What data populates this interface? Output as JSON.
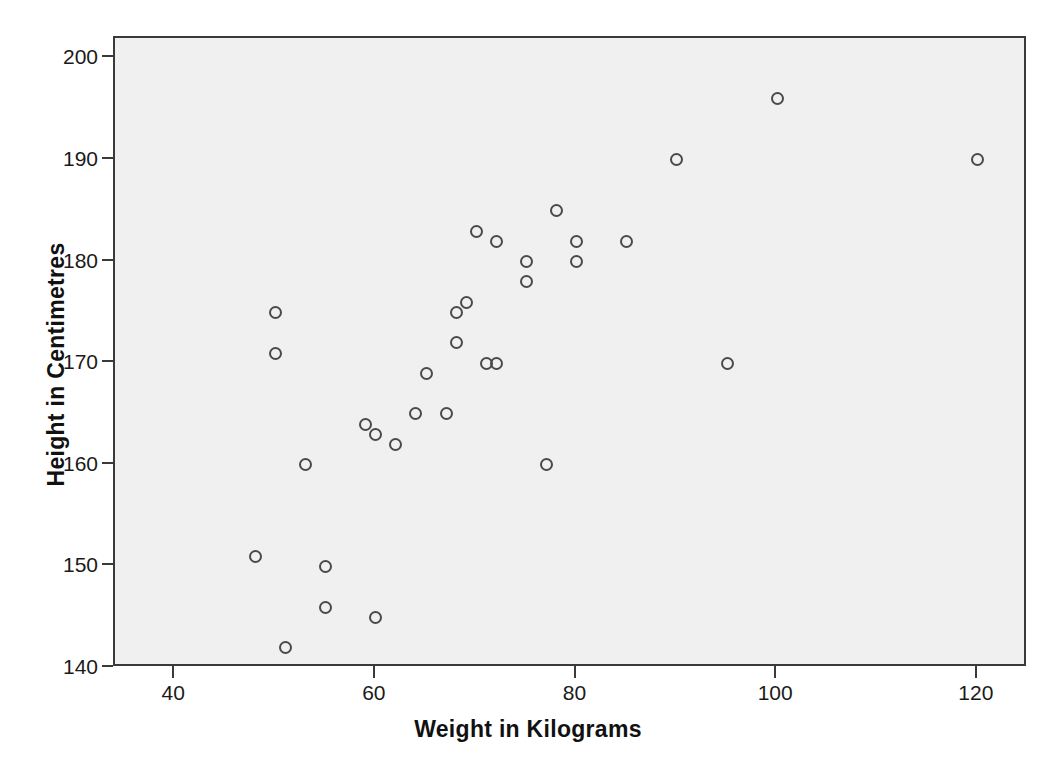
{
  "chart_data": {
    "type": "scatter",
    "title": "",
    "xlabel": "Weight in Kilograms",
    "ylabel": "Height in Centimetres",
    "xlim": [
      34,
      125
    ],
    "ylim": [
      140,
      202
    ],
    "xticks": [
      40,
      60,
      80,
      100,
      120
    ],
    "yticks": [
      140,
      150,
      160,
      170,
      180,
      190,
      200
    ],
    "grid": false,
    "legend": null,
    "marker": "open-circle",
    "marker_color": "#4a4a4a",
    "plot_background": "#f0f0f0",
    "page_background": "#ffffff",
    "x": [
      48,
      50,
      50,
      51,
      53,
      55,
      55,
      59,
      59,
      60,
      60,
      62,
      64,
      65,
      67,
      68,
      68,
      69,
      70,
      70,
      71,
      72,
      72,
      75,
      75,
      75,
      77,
      78,
      80,
      80,
      85,
      90,
      95,
      100,
      120
    ],
    "y": [
      151,
      175,
      171,
      142,
      160,
      150,
      146,
      164,
      163,
      145,
      163,
      162,
      165,
      169,
      165,
      172,
      175,
      176,
      183,
      180,
      170,
      170,
      182,
      180,
      178,
      176,
      160,
      185,
      182,
      180,
      182,
      190,
      170,
      196,
      190
    ],
    "points": [
      {
        "x": 48,
        "y": 151
      },
      {
        "x": 50,
        "y": 175
      },
      {
        "x": 50,
        "y": 171
      },
      {
        "x": 51,
        "y": 142
      },
      {
        "x": 53,
        "y": 160
      },
      {
        "x": 55,
        "y": 150
      },
      {
        "x": 55,
        "y": 146
      },
      {
        "x": 59,
        "y": 164
      },
      {
        "x": 60,
        "y": 163
      },
      {
        "x": 60,
        "y": 145
      },
      {
        "x": 62,
        "y": 162
      },
      {
        "x": 64,
        "y": 165
      },
      {
        "x": 65,
        "y": 169
      },
      {
        "x": 67,
        "y": 165
      },
      {
        "x": 68,
        "y": 172
      },
      {
        "x": 68,
        "y": 175
      },
      {
        "x": 69,
        "y": 176
      },
      {
        "x": 70,
        "y": 183
      },
      {
        "x": 71,
        "y": 170
      },
      {
        "x": 72,
        "y": 170
      },
      {
        "x": 72,
        "y": 182
      },
      {
        "x": 75,
        "y": 180
      },
      {
        "x": 75,
        "y": 178
      },
      {
        "x": 77,
        "y": 160
      },
      {
        "x": 78,
        "y": 185
      },
      {
        "x": 80,
        "y": 182
      },
      {
        "x": 80,
        "y": 180
      },
      {
        "x": 85,
        "y": 182
      },
      {
        "x": 90,
        "y": 190
      },
      {
        "x": 95,
        "y": 170
      },
      {
        "x": 100,
        "y": 196
      },
      {
        "x": 120,
        "y": 190
      }
    ]
  }
}
